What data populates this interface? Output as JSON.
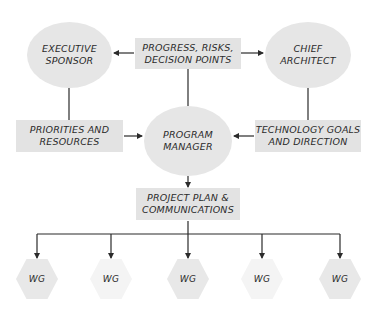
{
  "diagram": {
    "colors": {
      "node_fill": "#e6e6e6",
      "box_fill": "#e3e3e3",
      "hex_fill": "#e8e8e8",
      "hex_fill_light": "#f4f4f4",
      "line": "#2b2b2b",
      "text": "#2b2b2b"
    },
    "nodes": {
      "executive_sponsor": {
        "label": "EXECUTIVE\nSPONSOR",
        "shape": "ellipse"
      },
      "chief_architect": {
        "label": "CHIEF\nARCHITECT",
        "shape": "ellipse"
      },
      "program_manager": {
        "label": "PROGRAM\nMANAGER",
        "shape": "ellipse"
      },
      "progress_risks": {
        "label": "PROGRESS, RISKS,\nDECISION POINTS",
        "shape": "rectangle"
      },
      "priorities_resources": {
        "label": "PRIORITIES AND\nRESOURCES",
        "shape": "rectangle"
      },
      "technology_goals": {
        "label": "TECHNOLOGY GOALS\nAND DIRECTION",
        "shape": "rectangle"
      },
      "project_plan": {
        "label": "PROJECT PLAN &\nCOMMUNICATIONS",
        "shape": "rectangle"
      }
    },
    "working_groups": [
      {
        "label": "WG",
        "shade": "dark"
      },
      {
        "label": "WG",
        "shade": "light"
      },
      {
        "label": "WG",
        "shade": "dark"
      },
      {
        "label": "WG",
        "shade": "light"
      },
      {
        "label": "WG",
        "shade": "dark"
      }
    ],
    "edges": [
      {
        "from": "progress_risks",
        "to": "executive_sponsor",
        "arrow": true
      },
      {
        "from": "progress_risks",
        "to": "chief_architect",
        "arrow": true
      },
      {
        "from": "progress_risks",
        "to": "program_manager",
        "arrow": false
      },
      {
        "from": "executive_sponsor",
        "to": "priorities_resources",
        "arrow": false
      },
      {
        "from": "priorities_resources",
        "to": "program_manager",
        "arrow": true
      },
      {
        "from": "chief_architect",
        "to": "technology_goals",
        "arrow": false
      },
      {
        "from": "technology_goals",
        "to": "program_manager",
        "arrow": true
      },
      {
        "from": "program_manager",
        "to": "project_plan",
        "arrow": true
      },
      {
        "from": "project_plan",
        "to": "working_groups",
        "arrow": true
      }
    ]
  }
}
